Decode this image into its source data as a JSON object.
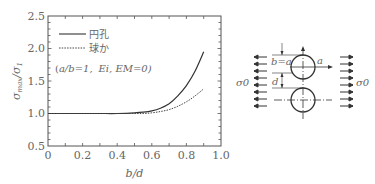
{
  "chart_data": {
    "type": "line",
    "title": "",
    "xlabel": "b/d",
    "ylabel": "σmax/σ1",
    "xlim": [
      0,
      1.0
    ],
    "ylim": [
      0.5,
      2.5
    ],
    "xticks": [
      "0",
      "0.2",
      "0.4",
      "0.6",
      "0.8",
      "1.0"
    ],
    "yticks": [
      "0.5",
      "1.0",
      "1.5",
      "2.0",
      "2.5"
    ],
    "grid": false,
    "legend_position": "upper-left",
    "annotation": "(a/b=1,  Ei, EM=0)",
    "series": [
      {
        "name": "円孔",
        "style": "solid",
        "x": [
          0,
          0.1,
          0.2,
          0.3,
          0.4,
          0.5,
          0.55,
          0.6,
          0.65,
          0.7,
          0.75,
          0.8,
          0.85,
          0.9
        ],
        "y": [
          1.0,
          1.0,
          1.0,
          1.0,
          1.0,
          1.01,
          1.02,
          1.04,
          1.08,
          1.15,
          1.27,
          1.43,
          1.65,
          1.95
        ]
      },
      {
        "name": "球か",
        "style": "dashed",
        "x": [
          0,
          0.1,
          0.2,
          0.3,
          0.4,
          0.5,
          0.55,
          0.6,
          0.65,
          0.7,
          0.75,
          0.8,
          0.85,
          0.9
        ],
        "y": [
          1.0,
          1.0,
          1.0,
          1.0,
          1.0,
          1.0,
          1.0,
          1.01,
          1.03,
          1.06,
          1.11,
          1.18,
          1.27,
          1.38
        ]
      }
    ]
  },
  "legend": {
    "solid_label": "円孔",
    "dashed_label": "球か"
  },
  "annotation": {
    "text_open": "(",
    "a_over_b": "a/b=1,",
    "ei_em": "Ei, EM=0)"
  },
  "axes": {
    "xlabel": "b/d",
    "ylabel_main": "σ",
    "ylabel_sub": "max",
    "ylabel_den": "/σ",
    "ylabel_den_sub": "1",
    "xticks": [
      "0",
      "0.2",
      "0.4",
      "0.6",
      "0.8",
      "1.0"
    ],
    "yticks": [
      "2.5",
      "2.0",
      "1.5",
      "1.0",
      "0.5"
    ]
  },
  "diagram": {
    "left_stress": "σ0",
    "right_stress": "σ0",
    "b_eq_a": "b=a",
    "a_label": "a",
    "d_label": "d"
  }
}
